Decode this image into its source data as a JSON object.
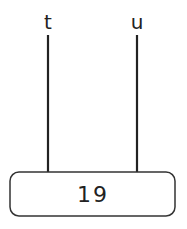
{
  "diagram": {
    "wires": [
      {
        "label": "t"
      },
      {
        "label": "u"
      }
    ],
    "box": {
      "label": "19"
    },
    "colors": {
      "stroke": "#222222",
      "background": "#ffffff"
    }
  }
}
